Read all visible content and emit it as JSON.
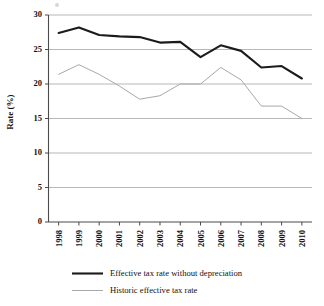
{
  "chart_data": {
    "type": "line",
    "title": "",
    "xlabel": "",
    "ylabel": "Rate (%)",
    "categories": [
      "1998",
      "1999",
      "2000",
      "2001",
      "2002",
      "2003",
      "2004",
      "2005",
      "2006",
      "2007",
      "2008",
      "2009",
      "2010"
    ],
    "x": [
      1998,
      1999,
      2000,
      2001,
      2002,
      2003,
      2004,
      2005,
      2006,
      2007,
      2008,
      2009,
      2010
    ],
    "ylim": [
      0,
      30
    ],
    "yticks": [
      0,
      5,
      10,
      15,
      20,
      25,
      30
    ],
    "ytick_labels": [
      "0",
      "5",
      "10",
      "15",
      "20",
      "25",
      "30"
    ],
    "grid": true,
    "legend_position": "bottom",
    "series": [
      {
        "name": "Effective tax rate without depreciation",
        "color": "#1b1b1b",
        "style": "solid-thick",
        "values": [
          27.4,
          28.2,
          27.1,
          26.9,
          26.8,
          26.0,
          26.1,
          23.9,
          25.6,
          24.8,
          22.4,
          22.6,
          20.8
        ]
      },
      {
        "name": "Historic effective tax rate",
        "color": "#a8a8a8",
        "style": "solid-thin",
        "values": [
          21.4,
          22.8,
          21.4,
          19.7,
          17.8,
          18.3,
          20.0,
          20.0,
          22.4,
          20.6,
          16.8,
          16.8,
          15.0
        ]
      }
    ]
  },
  "axes": {
    "y_axis_title": "Rate (%)"
  },
  "legend": {
    "items": [
      {
        "label": "Effective tax rate without depreciation",
        "swatch": "thick-black-line"
      },
      {
        "label": "Historic effective tax rate",
        "swatch": "thin-gray-line"
      }
    ]
  },
  "colors": {
    "series_main": "#1b1b1b",
    "series_secondary": "#a8a8a8",
    "gridline": "#9a9a9a",
    "axis": "#4a4a4a",
    "text": "#111111",
    "background": "#ffffff"
  }
}
